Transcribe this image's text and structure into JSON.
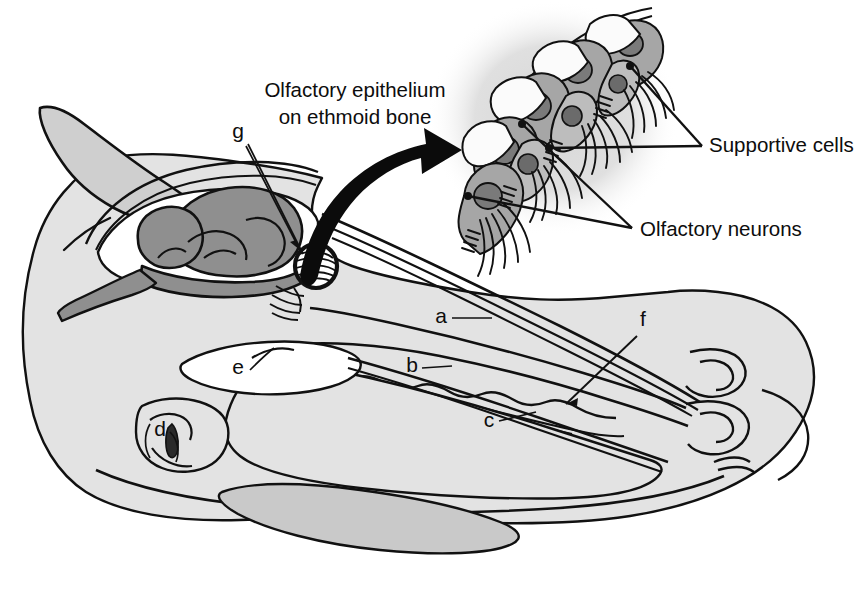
{
  "figure": {
    "background_color": "#ffffff",
    "ink_color": "#111111"
  },
  "palette": {
    "outline": "#111111",
    "head_fill": "#e3e3e3",
    "brain_fill": "#8f8f8f",
    "ear_fill": "#cfcfcf",
    "tongue_fill": "#c9c9c9",
    "inset_halo": "#dedede",
    "inset_cell_grey": "#a6a6a6",
    "inset_cell_light": "#fbfbfb",
    "inset_nucleus": "#7a7a7a",
    "inset_nucleus_dark": "#6b6b6b",
    "white": "#ffffff"
  },
  "callouts": [
    {
      "id": "olfactory-epithelium",
      "text_line1": "Olfactory epithelium",
      "text_line2": "on ethmoid bone",
      "x": 355,
      "y": 97,
      "anchor": "middle",
      "pointer": "curved-arrow"
    },
    {
      "id": "supportive-cells",
      "text_line1": "Supportive cells",
      "text_line2": "",
      "x": 709,
      "y": 152,
      "anchor": "start",
      "pointer": "two-leader-lines"
    },
    {
      "id": "olfactory-neurons",
      "text_line1": "Olfactory neurons",
      "text_line2": "",
      "x": 640,
      "y": 236,
      "anchor": "start",
      "pointer": "two-leader-lines"
    }
  ],
  "letter_labels": [
    {
      "id": "a",
      "text": "a",
      "x": 441,
      "y": 323,
      "has_leader": true
    },
    {
      "id": "b",
      "text": "b",
      "x": 412,
      "y": 372,
      "has_leader": true
    },
    {
      "id": "c",
      "text": "c",
      "x": 489,
      "y": 427,
      "has_leader": true
    },
    {
      "id": "d",
      "text": "d",
      "x": 160,
      "y": 436,
      "has_leader": true
    },
    {
      "id": "e",
      "text": "e",
      "x": 238,
      "y": 374,
      "has_leader": true
    },
    {
      "id": "f",
      "text": "f",
      "x": 643,
      "y": 326,
      "has_leader": true
    },
    {
      "id": "g",
      "text": "g",
      "x": 238,
      "y": 138,
      "has_leader": true
    }
  ],
  "inset": {
    "name": "olfactory-epithelium-inset",
    "cell_count": 10,
    "description": "Pseudostratified olfactory epithelium with alternating supportive cells and olfactory neurons bearing cilia"
  },
  "arrow": {
    "name": "magnification-arrow",
    "from_x": 303,
    "from_y": 272,
    "to_x": 447,
    "to_y": 148
  }
}
